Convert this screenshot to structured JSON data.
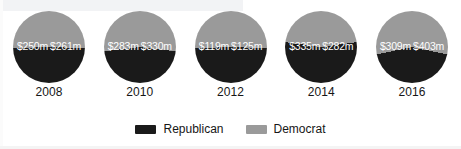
{
  "chart_data": {
    "type": "pie",
    "title": "",
    "subtitle": "",
    "xlabel": "",
    "ylabel": "",
    "grid": false,
    "legend_position": "bottom",
    "unit": "millions of US dollars",
    "categories": [
      "2008",
      "2010",
      "2012",
      "2014",
      "2016"
    ],
    "series": [
      {
        "name": "Republican",
        "color": "#1a1a1a",
        "values": [
          250,
          283,
          119,
          335,
          309
        ],
        "labels": [
          "$250m",
          "$283m",
          "$119m",
          "$335m",
          "$309m"
        ]
      },
      {
        "name": "Democrat",
        "color": "#9a9a9a",
        "values": [
          261,
          330,
          125,
          282,
          403
        ],
        "labels": [
          "$261m",
          "$330m",
          "$125m",
          "$282m",
          "$403m"
        ]
      }
    ],
    "pies": [
      {
        "year": "2008",
        "republican_label": "$250m",
        "democrat_label": "$261m",
        "republican_value": 250,
        "democrat_value": 261,
        "total": 511
      },
      {
        "year": "2010",
        "republican_label": "$283m",
        "democrat_label": "$330m",
        "republican_value": 283,
        "democrat_value": 330,
        "total": 613
      },
      {
        "year": "2012",
        "republican_label": "$119m",
        "democrat_label": "$125m",
        "republican_value": 119,
        "democrat_value": 125,
        "total": 244
      },
      {
        "year": "2014",
        "republican_label": "$335m",
        "democrat_label": "$282m",
        "republican_value": 335,
        "democrat_value": 282,
        "total": 617
      },
      {
        "year": "2016",
        "republican_label": "$309m",
        "democrat_label": "$403m",
        "republican_value": 309,
        "democrat_value": 403,
        "total": 712
      }
    ]
  },
  "legend": {
    "entries": [
      {
        "label": "Republican",
        "color": "#1a1a1a"
      },
      {
        "label": "Democrat",
        "color": "#9a9a9a"
      }
    ]
  }
}
